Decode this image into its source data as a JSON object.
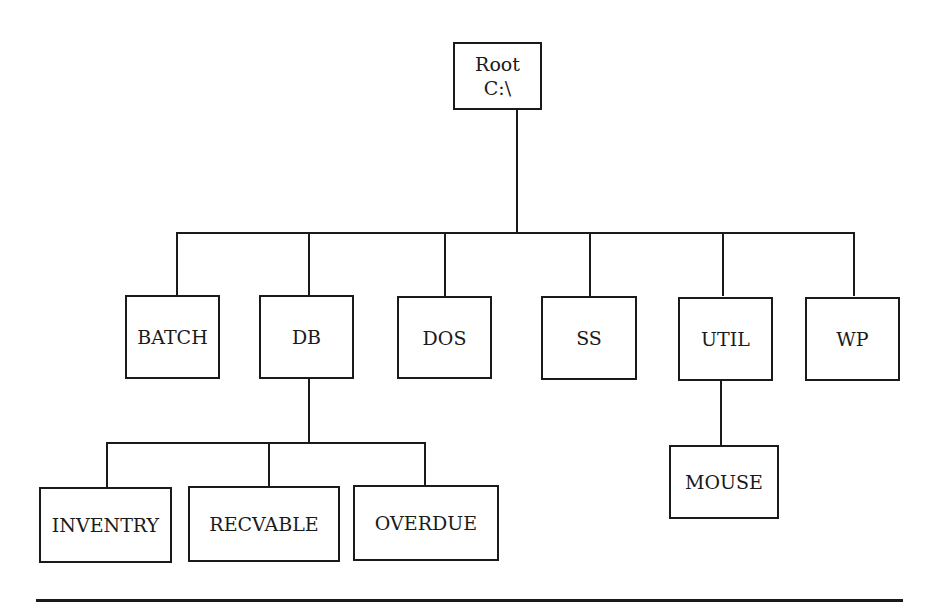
{
  "diagram": {
    "type": "directory-tree",
    "root": {
      "label": "Root",
      "path": "C:\\"
    },
    "level1": [
      "BATCH",
      "DB",
      "DOS",
      "SS",
      "UTIL",
      "WP"
    ],
    "db_children": [
      "INVENTRY",
      "RECVABLE",
      "OVERDUE"
    ],
    "util_children": [
      "MOUSE"
    ]
  },
  "colors": {
    "line": "#1a1a1a",
    "background": "#ffffff"
  }
}
